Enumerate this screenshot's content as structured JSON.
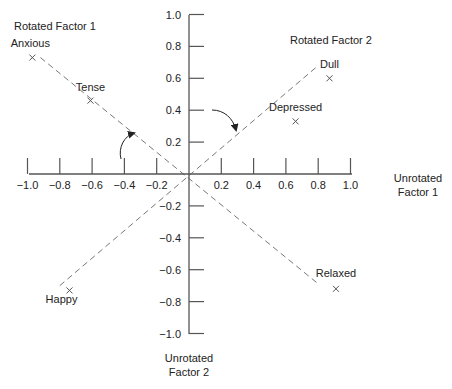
{
  "chart_data": {
    "type": "scatter",
    "title": "",
    "xlabel": "Unrotated Factor 1",
    "ylabel": "Unrotated Factor 2",
    "xlim": [
      -1.0,
      1.0
    ],
    "ylim": [
      -1.0,
      1.0
    ],
    "grid": false,
    "x_ticks": [
      -1.0,
      -0.8,
      -0.6,
      -0.4,
      -0.2,
      0.2,
      0.4,
      0.6,
      0.8,
      1.0
    ],
    "x_tick_labels": [
      "−1.0",
      "−0.8",
      "−0.6",
      "−0.4",
      "−0.2",
      "0.2",
      "0.4",
      "0.6",
      "0.8",
      "1.0"
    ],
    "y_ticks": [
      1.0,
      0.8,
      0.6,
      0.4,
      0.2,
      -0.2,
      -0.4,
      -0.6,
      -0.8,
      -1.0
    ],
    "y_tick_labels": [
      "1.0",
      "0.8",
      "0.6",
      "0.4",
      "0.2",
      "−0.2",
      "−0.4",
      "−0.6",
      "−0.8",
      "−1.0"
    ],
    "points": [
      {
        "label": "Anxious",
        "x": -0.97,
        "y": 0.73
      },
      {
        "label": "Tense",
        "x": -0.61,
        "y": 0.46
      },
      {
        "label": "Dull",
        "x": 0.87,
        "y": 0.6
      },
      {
        "label": "Depressed",
        "x": 0.66,
        "y": 0.33
      },
      {
        "label": "Happy",
        "x": -0.74,
        "y": -0.73
      },
      {
        "label": "Relaxed",
        "x": 0.91,
        "y": -0.72
      }
    ],
    "rotated_axes": [
      {
        "name": "Rotated Factor 1",
        "from": [
          -0.92,
          0.73
        ],
        "to": [
          0.79,
          -0.68
        ],
        "style": "dashed"
      },
      {
        "name": "Rotated Factor 2",
        "from": [
          -0.8,
          -0.7
        ],
        "to": [
          0.8,
          0.68
        ],
        "style": "dashed"
      }
    ],
    "annotations": [
      "Rotated Factor 1",
      "Rotated Factor 2",
      "rotation arrows (clockwise)"
    ],
    "marker": "x"
  },
  "labels": {
    "rotated_factor_1": "Rotated Factor 1",
    "rotated_factor_2": "Rotated Factor 2",
    "unrotated_f1_line1": "Unrotated",
    "unrotated_f1_line2": "Factor 1",
    "unrotated_f2_line1": "Unrotated",
    "unrotated_f2_line2": "Factor 2"
  },
  "colors": {
    "axis": "#555555",
    "dashed": "#777777",
    "text": "#222222",
    "marker": "#555555"
  }
}
